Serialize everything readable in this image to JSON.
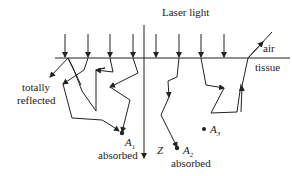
{
  "diagram": {
    "title": "Laser light",
    "labels": {
      "laser": "Laser light",
      "air": "air",
      "tissue": "tissue",
      "totally_reflected_line1": "totally",
      "totally_reflected_line2": "reflected",
      "z_axis": "Z",
      "a1": "A",
      "a1_sub": "1",
      "a1_status": "absorbed",
      "a2": "A",
      "a2_sub": "2",
      "a2_status": "absorbed",
      "a3": "A",
      "a3_sub": "3"
    },
    "colors": {
      "line": "#222222",
      "background": "#ffffff"
    }
  }
}
